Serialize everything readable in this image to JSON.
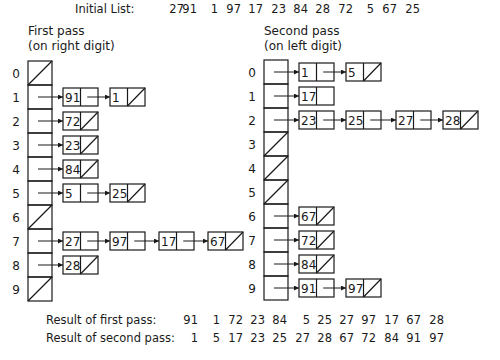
{
  "initial_list": {
    "label": "Initial List:",
    "values": [
      "27",
      "91",
      "1",
      "97",
      "17",
      "23",
      "84",
      "28",
      "72",
      "5",
      "67",
      "25"
    ]
  },
  "first_pass": {
    "title_line1": "First pass",
    "title_line2": "(on right digit)",
    "buckets": [
      {
        "index": "0",
        "items": []
      },
      {
        "index": "1",
        "items": [
          "91",
          "1"
        ]
      },
      {
        "index": "2",
        "items": [
          "72"
        ]
      },
      {
        "index": "3",
        "items": [
          "23"
        ]
      },
      {
        "index": "4",
        "items": [
          "84"
        ]
      },
      {
        "index": "5",
        "items": [
          "5",
          "25"
        ]
      },
      {
        "index": "6",
        "items": []
      },
      {
        "index": "7",
        "items": [
          "27",
          "97",
          "17",
          "67"
        ]
      },
      {
        "index": "8",
        "items": [
          "28"
        ]
      },
      {
        "index": "9",
        "items": []
      }
    ]
  },
  "second_pass": {
    "title_line1": "Second pass",
    "title_line2": "(on left digit)",
    "buckets": [
      {
        "index": "0",
        "items": [
          "1",
          "5"
        ]
      },
      {
        "index": "1",
        "items": [
          "17"
        ],
        "last_null_marker": false
      },
      {
        "index": "2",
        "items": [
          "23",
          "25",
          "27",
          "28"
        ]
      },
      {
        "index": "3",
        "items": []
      },
      {
        "index": "4",
        "items": []
      },
      {
        "index": "5",
        "items": []
      },
      {
        "index": "6",
        "items": [
          "67"
        ]
      },
      {
        "index": "7",
        "items": [
          "72"
        ]
      },
      {
        "index": "8",
        "items": [
          "84"
        ]
      },
      {
        "index": "9",
        "items": [
          "91",
          "97"
        ]
      }
    ]
  },
  "results": {
    "first_label": "Result of first pass:",
    "first_values": [
      "91",
      "1",
      "72",
      "23",
      "84",
      "5",
      "25",
      "27",
      "97",
      "17",
      "67",
      "28"
    ],
    "second_label": "Result of second pass:",
    "second_values": [
      "1",
      "5",
      "17",
      "23",
      "25",
      "27",
      "28",
      "67",
      "72",
      "84",
      "91",
      "97"
    ]
  },
  "colors": {
    "line": "#1a1a1a",
    "background": "#ffffff"
  }
}
